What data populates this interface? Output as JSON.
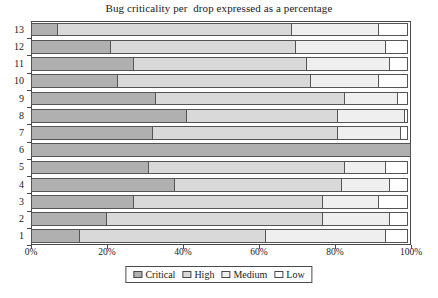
{
  "chart_data": {
    "type": "bar",
    "orientation": "horizontal",
    "stacked": true,
    "stacked_percent": true,
    "title": "Bug criticality per  drop expressed as a percentage",
    "xlabel": "",
    "ylabel": "",
    "xlim": [
      0,
      100
    ],
    "grid": false,
    "legend_position": "bottom",
    "x_ticks": [
      "0%",
      "20%",
      "40%",
      "60%",
      "80%",
      "100%"
    ],
    "x_tick_values": [
      0,
      20,
      40,
      60,
      80,
      100
    ],
    "categories": [
      "1",
      "2",
      "3",
      "4",
      "5",
      "6",
      "7",
      "8",
      "9",
      "10",
      "11",
      "12",
      "13"
    ],
    "category_order_top_to_bottom": [
      "13",
      "12",
      "11",
      "10",
      "9",
      "8",
      "7",
      "6",
      "5",
      "4",
      "3",
      "2",
      "1"
    ],
    "series": [
      {
        "name": "Critical",
        "color": "#b0b0b0",
        "values": [
          13,
          20,
          27,
          38,
          31,
          100,
          32,
          41,
          33,
          23,
          27,
          21,
          7
        ]
      },
      {
        "name": "High",
        "color": "#d9d9d9",
        "values": [
          49,
          57,
          50,
          44,
          52,
          0,
          49,
          40,
          50,
          51,
          46,
          49,
          62
        ]
      },
      {
        "name": "Medium",
        "color": "#efefef",
        "values": [
          32,
          18,
          15,
          13,
          11,
          0,
          17,
          18,
          14,
          18,
          22,
          24,
          23
        ]
      },
      {
        "name": "Low",
        "color": "#ffffff",
        "values": [
          6,
          5,
          8,
          5,
          6,
          0,
          2,
          1,
          3,
          8,
          5,
          6,
          8
        ]
      }
    ]
  },
  "legend": {
    "items": [
      {
        "label": "Critical",
        "swatch": "legend-swatch-critical"
      },
      {
        "label": "High",
        "swatch": "legend-swatch-high"
      },
      {
        "label": "Medium",
        "swatch": "legend-swatch-medium"
      },
      {
        "label": "Low",
        "swatch": "legend-swatch-low"
      }
    ]
  }
}
